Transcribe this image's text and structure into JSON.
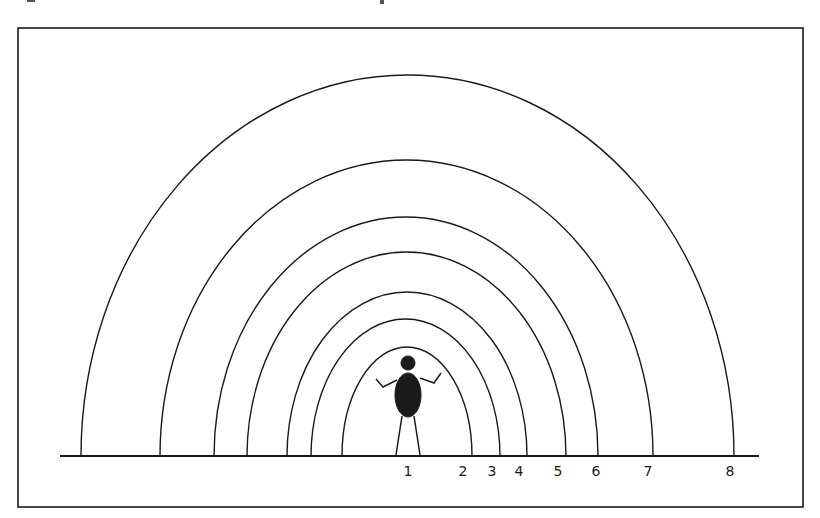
{
  "diagram": {
    "colors": {
      "ink": "#1a1a1a",
      "background": "#ffffff"
    },
    "frame": {
      "x": 18,
      "y": 28,
      "width": 785,
      "height": 479
    },
    "ground_line": {
      "x1": 60,
      "x2": 759,
      "y": 456
    },
    "center_x": 407,
    "arcs": [
      {
        "zone": 8,
        "left": 81,
        "right": 734,
        "top": 75
      },
      {
        "zone": 7,
        "left": 160,
        "right": 653,
        "top": 160
      },
      {
        "zone": 6,
        "left": 214,
        "right": 598,
        "top": 217
      },
      {
        "zone": 5,
        "left": 247,
        "right": 566,
        "top": 252
      },
      {
        "zone": 4,
        "left": 287,
        "right": 527,
        "top": 292
      },
      {
        "zone": 3,
        "left": 311,
        "right": 500,
        "top": 319
      },
      {
        "zone": 2,
        "left": 342,
        "right": 472,
        "top": 347
      }
    ],
    "labels": [
      {
        "text": "1",
        "x": 408
      },
      {
        "text": "2",
        "x": 463
      },
      {
        "text": "3",
        "x": 492
      },
      {
        "text": "4",
        "x": 519
      },
      {
        "text": "5",
        "x": 558
      },
      {
        "text": "6",
        "x": 596
      },
      {
        "text": "7",
        "x": 648
      },
      {
        "text": "8",
        "x": 730
      }
    ],
    "person": {
      "name": "person-figure",
      "head": {
        "cx": 408,
        "cy": 363,
        "r": 7
      },
      "body": {
        "cx": 408,
        "cy": 395,
        "rx": 13,
        "ry": 22
      }
    }
  }
}
